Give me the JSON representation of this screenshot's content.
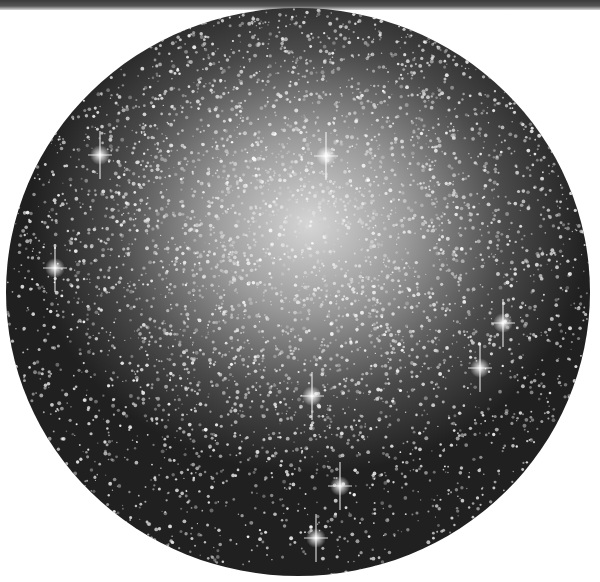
{
  "image": {
    "subject": "globular star cluster photograph",
    "description": "Black-and-white astronomical photograph showing a dense globular cluster inside a circular field of view on a white background, with a dark strip along the top edge.",
    "colors": {
      "background": "#ffffff",
      "core": "#d6d6d6",
      "edge": "#202020",
      "stars": "#ffffff"
    },
    "bright_stars": [
      {
        "x": 55,
        "y": 268
      },
      {
        "x": 312,
        "y": 396
      },
      {
        "x": 340,
        "y": 486
      },
      {
        "x": 316,
        "y": 538
      },
      {
        "x": 503,
        "y": 323
      },
      {
        "x": 480,
        "y": 368
      },
      {
        "x": 326,
        "y": 156
      },
      {
        "x": 100,
        "y": 155
      }
    ]
  }
}
